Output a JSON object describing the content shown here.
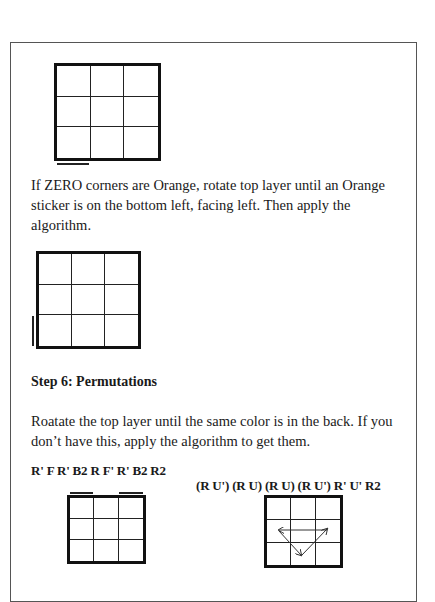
{
  "document": {
    "zero_corners_text": "If ZERO corners are Orange, rotate top layer until an Orange sticker is on the bottom left, facing left. Then apply the algorithm.",
    "step6": {
      "heading": "Step 6: Permutations",
      "description": "Roatate the top layer until the same color is in the back. If you don’t have this, apply the algorithm to get them.",
      "algorithms": [
        {
          "label": "R' F R' B2 R F' R' B2 R2",
          "diagram": "top-face-grid-with-two-back-corner-bars"
        },
        {
          "label": "(R U') (R U) (R U) (R U') R' U' R2",
          "diagram": "top-face-grid-with-edge-cycle-arrows"
        }
      ]
    },
    "diagrams": [
      {
        "name": "grid-zero-corners-before",
        "marker": "bottom-left sticker bar below"
      },
      {
        "name": "grid-zero-corners-after",
        "marker": "bottom-left sticker bar on left side"
      }
    ],
    "colors": {
      "line": "#111111",
      "frame": "#555555",
      "background": "#ffffff"
    }
  }
}
